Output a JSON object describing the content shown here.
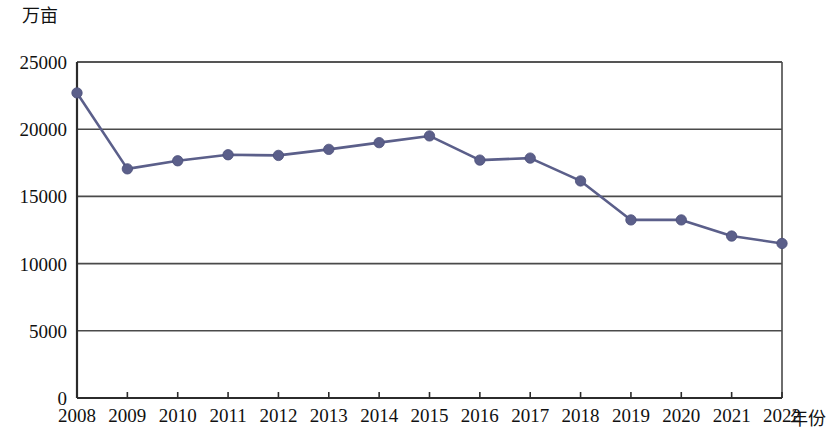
{
  "chart_data": {
    "type": "line",
    "title": "",
    "subtitle": "",
    "xlabel": "年份",
    "ylabel": "万亩",
    "categories": [
      "2008",
      "2009",
      "2010",
      "2011",
      "2012",
      "2013",
      "2014",
      "2015",
      "2016",
      "2017",
      "2018",
      "2019",
      "2020",
      "2021",
      "2022"
    ],
    "values": [
      22700,
      17050,
      17650,
      18100,
      18050,
      18500,
      19000,
      19500,
      17700,
      17850,
      16150,
      13250,
      13250,
      12050,
      11500
    ],
    "series": [
      {
        "name": "面积",
        "values": [
          22700,
          17050,
          17650,
          18100,
          18050,
          18500,
          19000,
          19500,
          17700,
          17850,
          16150,
          13250,
          13250,
          12050,
          11500
        ]
      }
    ],
    "ylim": [
      0,
      25000
    ],
    "y_ticks": [
      "0",
      "5000",
      "10000",
      "15000",
      "20000",
      "25000"
    ],
    "y_tick_values": [
      0,
      5000,
      10000,
      15000,
      20000,
      25000
    ],
    "grid": "horizontal",
    "legend": "none",
    "marker": "circle",
    "colors": {
      "series": "#5b5f8a",
      "axis": "#2b2b2b",
      "grid": "#4a4a4a",
      "text": "#111111",
      "background": "#ffffff"
    }
  },
  "axes": {
    "y_title": "万亩",
    "x_title": "年份"
  }
}
